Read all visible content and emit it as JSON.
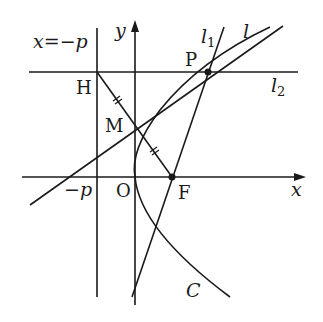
{
  "figure": {
    "stroke_color": "#1a1a1a",
    "background": "#ffffff"
  },
  "labels": {
    "directrix": "x=−p",
    "y_axis": "y",
    "x_axis": "x",
    "l1": "l",
    "l1_sub": "1",
    "l": "l",
    "l2": "l",
    "l2_sub": "2",
    "H": "H",
    "P": "P",
    "M": "M",
    "neg_p": "−p",
    "O": "O",
    "F": "F",
    "C": "C"
  },
  "points": {
    "H": [
      97,
      72
    ],
    "P": [
      208,
      72
    ],
    "M": [
      135,
      124
    ],
    "F": [
      172,
      177
    ],
    "O": [
      135,
      177
    ]
  }
}
